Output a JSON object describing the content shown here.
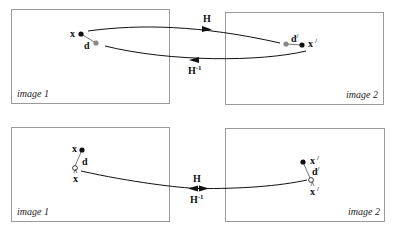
{
  "diagram": {
    "type": "homography-transfer-error-illustration",
    "panels": [
      {
        "id": "top",
        "left_caption": "image 1",
        "right_caption": "image 2",
        "left_points": {
          "x_label": "x",
          "d_label": "d"
        },
        "right_points": {
          "d_label": "d",
          "d_prime": "/",
          "x_label": "x",
          "x_prime": "/"
        },
        "forward_label": "H",
        "inverse_label": "H",
        "inverse_sup": "-1"
      },
      {
        "id": "bottom",
        "left_caption": "image 1",
        "right_caption": "image 2",
        "left_points": {
          "x_label": "x",
          "d_label": "d",
          "xhat_label": "x",
          "hat": "^"
        },
        "right_points": {
          "x_label": "x",
          "x_prime": "/",
          "d_label": "d",
          "d_prime": "/",
          "xhat_label": "x",
          "xhat_prime": "/",
          "hat": "^"
        },
        "forward_label": "H",
        "inverse_label": "H",
        "inverse_sup": "-1"
      }
    ],
    "colors": {
      "box_stroke": "#9a9a9a",
      "measured_point": "#111111",
      "projected_point": "#888888",
      "estimated_point_fill": "#ffffff"
    }
  }
}
